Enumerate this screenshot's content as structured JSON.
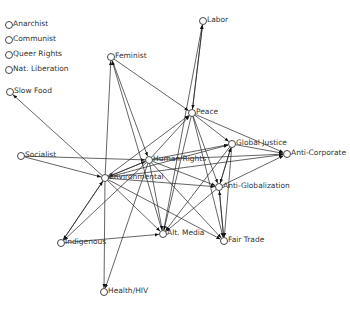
{
  "diagram": {
    "type": "directed-network",
    "node_color": "#333333",
    "edge_color": "#222222",
    "nodes": [
      {
        "id": "anarchist",
        "label": "Anarchist",
        "x": 9,
        "y": 25
      },
      {
        "id": "communist",
        "label": "Communist",
        "x": 9,
        "y": 40
      },
      {
        "id": "queer",
        "label": "Queer Rights",
        "x": 9,
        "y": 55
      },
      {
        "id": "natlib",
        "label": "Nat. Liberation",
        "x": 9,
        "y": 70
      },
      {
        "id": "slowfood",
        "label": "Slow Food",
        "x": 10,
        "y": 92
      },
      {
        "id": "labor",
        "label": "Labor",
        "x": 203,
        "y": 21
      },
      {
        "id": "feminist",
        "label": "Feminist",
        "x": 111,
        "y": 57
      },
      {
        "id": "peace",
        "label": "Peace",
        "x": 192,
        "y": 113
      },
      {
        "id": "globaljustice",
        "label": "Global Justice",
        "x": 232,
        "y": 144
      },
      {
        "id": "anticorp",
        "label": "Anti-Corporate",
        "x": 287,
        "y": 154
      },
      {
        "id": "socialist",
        "label": "Socialist",
        "x": 21,
        "y": 156
      },
      {
        "id": "humanrights",
        "label": "Human Rights",
        "x": 149,
        "y": 160
      },
      {
        "id": "environmental",
        "label": "Environmental",
        "x": 105,
        "y": 178
      },
      {
        "id": "antiglob",
        "label": "Anti-Globalization",
        "x": 219,
        "y": 187
      },
      {
        "id": "indigenous",
        "label": "Indigenous",
        "x": 61,
        "y": 243
      },
      {
        "id": "altmedia",
        "label": "Alt. Media",
        "x": 163,
        "y": 234
      },
      {
        "id": "fairtrade",
        "label": "Fair Trade",
        "x": 224,
        "y": 241
      },
      {
        "id": "health",
        "label": "Health/HIV",
        "x": 104,
        "y": 292
      }
    ],
    "edges": [
      [
        "environmental",
        "slowfood"
      ],
      [
        "socialist",
        "environmental"
      ],
      [
        "socialist",
        "humanrights"
      ],
      [
        "environmental",
        "feminist"
      ],
      [
        "altmedia",
        "feminist"
      ],
      [
        "feminist",
        "peace"
      ],
      [
        "peace",
        "labor"
      ],
      [
        "labor",
        "peace"
      ],
      [
        "altmedia",
        "labor"
      ],
      [
        "humanrights",
        "peace"
      ],
      [
        "environmental",
        "peace"
      ],
      [
        "humanrights",
        "globaljustice"
      ],
      [
        "environmental",
        "globaljustice"
      ],
      [
        "peace",
        "globaljustice"
      ],
      [
        "peace",
        "anticorp"
      ],
      [
        "globaljustice",
        "anticorp"
      ],
      [
        "humanrights",
        "anticorp"
      ],
      [
        "antiglob",
        "anticorp"
      ],
      [
        "environmental",
        "anticorp"
      ],
      [
        "humanrights",
        "antiglob"
      ],
      [
        "environmental",
        "antiglob"
      ],
      [
        "peace",
        "antiglob"
      ],
      [
        "globaljustice",
        "antiglob"
      ],
      [
        "antiglob",
        "globaljustice"
      ],
      [
        "peace",
        "altmedia"
      ],
      [
        "peace",
        "fairtrade"
      ],
      [
        "globaljustice",
        "fairtrade"
      ],
      [
        "antiglob",
        "fairtrade"
      ],
      [
        "fairtrade",
        "antiglob"
      ],
      [
        "humanrights",
        "fairtrade"
      ],
      [
        "environmental",
        "fairtrade"
      ],
      [
        "humanrights",
        "altmedia"
      ],
      [
        "environmental",
        "altmedia"
      ],
      [
        "globaljustice",
        "altmedia"
      ],
      [
        "antiglob",
        "altmedia"
      ],
      [
        "indigenous",
        "altmedia"
      ],
      [
        "environmental",
        "indigenous"
      ],
      [
        "indigenous",
        "environmental"
      ],
      [
        "humanrights",
        "indigenous"
      ],
      [
        "environmental",
        "health"
      ],
      [
        "humanrights",
        "health"
      ],
      [
        "environmental",
        "humanrights"
      ],
      [
        "humanrights",
        "environmental"
      ],
      [
        "feminist",
        "humanrights"
      ]
    ]
  }
}
